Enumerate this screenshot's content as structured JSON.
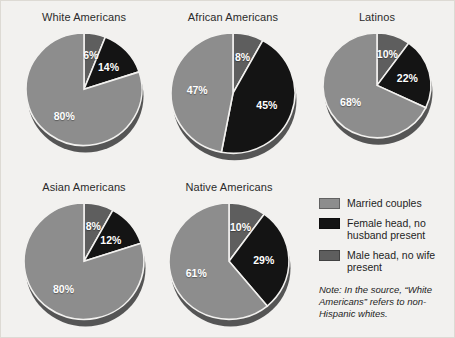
{
  "figure": {
    "background_color": "#f2f1ef",
    "border_color": "#dddad4"
  },
  "legend": {
    "items": [
      {
        "label": "Married couples",
        "color": "#8d8d8d",
        "key": "married"
      },
      {
        "label": "Female head, no husband present",
        "color": "#141414",
        "key": "female_head"
      },
      {
        "label": "Male head, no wife present",
        "color": "#5e5e5e",
        "key": "male_head"
      }
    ]
  },
  "note": {
    "prefix": "Note:",
    "text": "Note: In the source, “White Americans” refers to non-Hispanic whites."
  },
  "chart_data": [
    {
      "type": "pie",
      "title": "White Americans",
      "categories": [
        "Married couples",
        "Male head, no wife present",
        "Female head, no husband present"
      ],
      "values": [
        80,
        6,
        14
      ],
      "labels": [
        "80%",
        "6%",
        "14%"
      ],
      "colors": [
        "#8d8d8d",
        "#5e5e5e",
        "#141414"
      ]
    },
    {
      "type": "pie",
      "title": "African Americans",
      "categories": [
        "Married couples",
        "Male head, no wife present",
        "Female head, no husband present"
      ],
      "values": [
        47,
        8,
        45
      ],
      "labels": [
        "47%",
        "8%",
        "45%"
      ],
      "colors": [
        "#8d8d8d",
        "#5e5e5e",
        "#141414"
      ]
    },
    {
      "type": "pie",
      "title": "Latinos",
      "categories": [
        "Married couples",
        "Male head, no wife present",
        "Female head, no husband present"
      ],
      "values": [
        68,
        10,
        22
      ],
      "labels": [
        "68%",
        "10%",
        "22%"
      ],
      "colors": [
        "#8d8d8d",
        "#5e5e5e",
        "#141414"
      ]
    },
    {
      "type": "pie",
      "title": "Asian Americans",
      "categories": [
        "Married couples",
        "Male head, no wife present",
        "Female head, no husband present"
      ],
      "values": [
        80,
        8,
        12
      ],
      "labels": [
        "80%",
        "8%",
        "12%"
      ],
      "colors": [
        "#8d8d8d",
        "#5e5e5e",
        "#141414"
      ]
    },
    {
      "type": "pie",
      "title": "Native Americans",
      "categories": [
        "Married couples",
        "Male head, no wife present",
        "Female head, no husband present"
      ],
      "values": [
        61,
        10,
        29
      ],
      "labels": [
        "61%",
        "10%",
        "29%"
      ],
      "colors": [
        "#8d8d8d",
        "#5e5e5e",
        "#141414"
      ]
    }
  ],
  "layout": {
    "pies": [
      {
        "index": 0,
        "left": 8,
        "top": 10,
        "width": 150,
        "radius": 58,
        "title_gap": 6
      },
      {
        "index": 1,
        "left": 156,
        "top": 10,
        "width": 152,
        "radius": 62,
        "title_gap": 6
      },
      {
        "index": 2,
        "left": 306,
        "top": 10,
        "width": 140,
        "radius": 54,
        "title_gap": 6
      },
      {
        "index": 3,
        "left": 8,
        "top": 180,
        "width": 150,
        "radius": 60,
        "title_gap": 6
      },
      {
        "index": 4,
        "left": 152,
        "top": 180,
        "width": 152,
        "radius": 60,
        "title_gap": 6
      }
    ]
  }
}
